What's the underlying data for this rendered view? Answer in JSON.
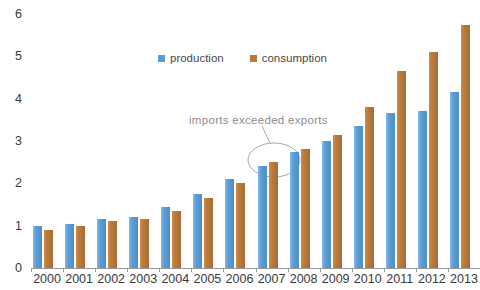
{
  "chart_data": {
    "type": "bar",
    "title": "",
    "subtitle": "",
    "xlabel": "",
    "ylabel": "",
    "categories": [
      "2000",
      "2001",
      "2002",
      "2003",
      "2004",
      "2005",
      "2006",
      "2007",
      "2008",
      "2009",
      "2010",
      "2011",
      "2012",
      "2013"
    ],
    "series": [
      {
        "name": "production",
        "color": "#5B9BD5",
        "values": [
          1.0,
          1.05,
          1.15,
          1.2,
          1.45,
          1.75,
          2.1,
          2.4,
          2.75,
          3.0,
          3.35,
          3.65,
          3.7,
          4.15
        ]
      },
      {
        "name": "consumption",
        "color": "#B8793A",
        "values": [
          0.9,
          1.0,
          1.1,
          1.15,
          1.35,
          1.65,
          2.0,
          2.5,
          2.8,
          3.15,
          3.8,
          4.65,
          5.1,
          5.75
        ]
      }
    ],
    "ylim": [
      0,
      6
    ],
    "yticks": [
      0,
      1,
      2,
      3,
      4,
      5,
      6
    ],
    "ytick_labels": [
      "0",
      "1",
      "2",
      "3",
      "4",
      "5",
      "6"
    ],
    "grid": false,
    "legend": {
      "position": "top-center",
      "entries": [
        {
          "label": "production",
          "color": "#5B9BD5"
        },
        {
          "label": "consumption",
          "color": "#B8793A"
        }
      ]
    },
    "annotations": [
      {
        "text": "imports exceeded exports",
        "target_category": "2007",
        "marker": "ellipse",
        "color": "#8d8d8d"
      }
    ]
  },
  "axis": {
    "line_color": "#9a9a9a"
  }
}
